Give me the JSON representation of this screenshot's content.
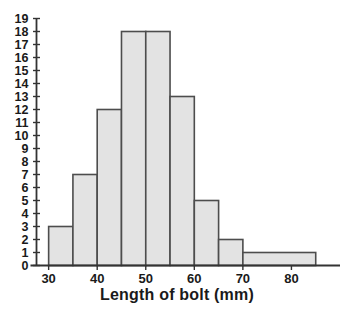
{
  "chart_data": {
    "type": "bar",
    "title": "",
    "subtitle": "",
    "xlabel": "Length of bolt (mm)",
    "ylabel": "",
    "grid": false,
    "legend": "none",
    "xlim": [
      27.5,
      90
    ],
    "ylim": [
      0,
      19
    ],
    "x_ticks": [
      30,
      40,
      50,
      60,
      70,
      80
    ],
    "x_tick_labels": [
      "30",
      "40",
      "50",
      "60",
      "70",
      "80"
    ],
    "y_ticks": [
      0,
      1,
      2,
      3,
      4,
      5,
      6,
      7,
      8,
      9,
      10,
      11,
      12,
      13,
      14,
      15,
      16,
      17,
      18,
      19
    ],
    "y_tick_labels": [
      "0",
      "1",
      "2",
      "3",
      "4",
      "5",
      "6",
      "7",
      "8",
      "9",
      "10",
      "11",
      "12",
      "13",
      "14",
      "15",
      "16",
      "17",
      "18",
      "19"
    ],
    "categories": [
      "30-35",
      "35-40",
      "40-45",
      "45-50",
      "50-55",
      "55-60",
      "60-65",
      "65-70",
      "70-85"
    ],
    "values": [
      3,
      7,
      12,
      18,
      18,
      13,
      5,
      2,
      1
    ],
    "bins": [
      {
        "label": "30-35",
        "start": 30,
        "end": 35,
        "frequency": 3
      },
      {
        "label": "35-40",
        "start": 35,
        "end": 40,
        "frequency": 7
      },
      {
        "label": "40-45",
        "start": 40,
        "end": 45,
        "frequency": 12
      },
      {
        "label": "45-50",
        "start": 45,
        "end": 50,
        "frequency": 18
      },
      {
        "label": "50-55",
        "start": 50,
        "end": 55,
        "frequency": 18
      },
      {
        "label": "55-60",
        "start": 55,
        "end": 60,
        "frequency": 13
      },
      {
        "label": "60-65",
        "start": 60,
        "end": 65,
        "frequency": 5
      },
      {
        "label": "65-70",
        "start": 65,
        "end": 70,
        "frequency": 2
      },
      {
        "label": "70-85",
        "start": 70,
        "end": 85,
        "frequency": 1
      }
    ],
    "colors": {
      "bar_fill": "#e3e3e3",
      "bar_stroke": "#4d4d4d",
      "axis": "#333333",
      "text": "#1a1a1a",
      "background": "#ffffff"
    }
  }
}
